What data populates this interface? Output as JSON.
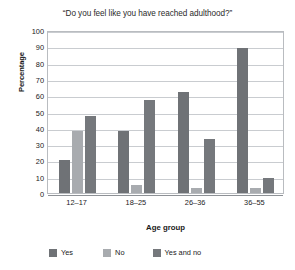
{
  "chart_data": {
    "type": "bar",
    "title": "“Do you feel like you have reached adulthood?”",
    "xlabel": "Age group",
    "ylabel": "Percentage",
    "categories": [
      "12–17",
      "18–25",
      "26–36",
      "36–55"
    ],
    "series": [
      {
        "name": "Yes",
        "color": "#6f7276",
        "values": [
          20,
          38,
          62,
          89
        ]
      },
      {
        "name": "No",
        "color": "#a8abaf",
        "values": [
          38,
          5,
          3,
          3
        ]
      },
      {
        "name": "Yes and no",
        "color": "#75787c",
        "values": [
          47,
          57,
          33,
          9
        ]
      }
    ],
    "ylim": [
      0,
      100
    ],
    "yticks": [
      0,
      10,
      20,
      30,
      40,
      50,
      60,
      70,
      80,
      90,
      100
    ],
    "grid": "horizontal",
    "legend_position": "bottom"
  }
}
